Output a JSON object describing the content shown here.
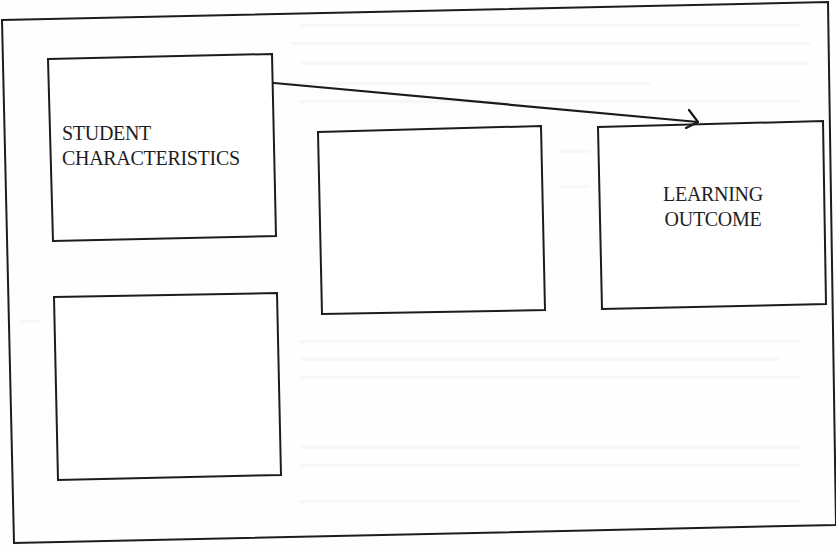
{
  "diagram": {
    "title": "",
    "frame": {
      "points": "2,20 828,2 836,525 14,543",
      "stroke": "#1c1c1c"
    },
    "nodes": [
      {
        "id": "student-characteristics",
        "lines": [
          "STUDENT",
          "CHARACTERISTICS"
        ],
        "points": "48,59 272,54 276,236 53,241",
        "label_pos": {
          "left": 62,
          "top": 121,
          "width": 210,
          "align": "left"
        }
      },
      {
        "id": "middle-empty",
        "lines": [],
        "points": "318,132 541,126 545,310 322,314"
      },
      {
        "id": "learning-outcome",
        "lines": [
          "LEARNING",
          "OUTCOME"
        ],
        "points": "598,127 823,121 826,304 602,309",
        "label_pos": {
          "left": 613,
          "top": 182,
          "width": 200,
          "align": "center"
        }
      },
      {
        "id": "bottom-left-empty",
        "lines": [],
        "points": "54,297 277,293 281,475 58,480"
      }
    ],
    "edges": [
      {
        "from": "student-characteristics",
        "to": "learning-outcome",
        "path": "M274,83 L698,122",
        "head": "M689,110 L698,122 L686,128"
      }
    ]
  }
}
